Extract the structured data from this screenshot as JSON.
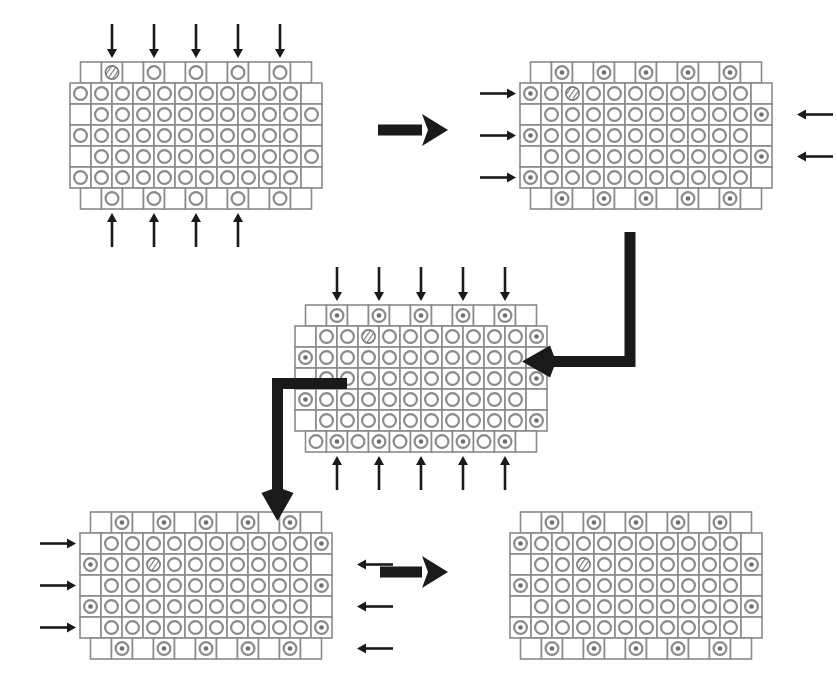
{
  "figure": {
    "background_color": "#ffffff",
    "cell_stroke_color": "#8a8a8a",
    "ring_stroke_color": "#8a8a8a",
    "dot_color": "#6e6e6e",
    "arrow_color": "#1a1a1a",
    "width": 815,
    "height": 683
  },
  "legend": {
    "cell_empty": "empty-lattice-cell",
    "cell_ring": "plain-ring-cell",
    "cell_ring_dot": "activated-ring-cell",
    "cell_hatched": "hatched-marker-cell"
  },
  "lattice": {
    "columns": 11,
    "rows": 7,
    "cell_size": 21,
    "description": "Staggered-edge rectangular lattice; interior rows of 11 cells with alternating left/right offset border cells; top and bottom rows hold alternating half-pitch cells."
  },
  "panels": [
    {
      "id": "panel-1",
      "name": "lattice-stage-1",
      "order": 1,
      "position": {
        "x": 70,
        "y": 62
      },
      "arrows": {
        "top": {
          "count": 5,
          "direction": "down",
          "label": "top-incident-arrows"
        },
        "bottom": {
          "count": 4,
          "direction": "up",
          "label": "bottom-incident-arrows"
        },
        "left": {
          "count": 0,
          "direction": "right",
          "label": "left-incident-arrows"
        },
        "right": {
          "count": 0,
          "direction": "left",
          "label": "right-incident-arrows"
        }
      },
      "marker_cell": {
        "row": 0,
        "col": 1,
        "type": "hatched"
      },
      "activated_count": 0
    },
    {
      "id": "panel-2",
      "name": "lattice-stage-2",
      "order": 2,
      "position": {
        "x": 520,
        "y": 62
      },
      "arrows": {
        "top": {
          "count": 0,
          "direction": "down",
          "label": "top-incident-arrows"
        },
        "bottom": {
          "count": 0,
          "direction": "up",
          "label": "bottom-incident-arrows"
        },
        "left": {
          "count": 3,
          "direction": "right",
          "label": "left-incident-arrows"
        },
        "right": {
          "count": 2,
          "direction": "left",
          "label": "right-incident-arrows"
        }
      },
      "marker_cell": {
        "row": 1,
        "col": 2,
        "type": "hatched"
      },
      "activated_count": 15
    },
    {
      "id": "panel-3",
      "name": "lattice-stage-3",
      "order": 3,
      "position": {
        "x": 295,
        "y": 305
      },
      "arrows": {
        "top": {
          "count": 5,
          "direction": "down",
          "label": "top-incident-arrows"
        },
        "bottom": {
          "count": 5,
          "direction": "up",
          "label": "bottom-incident-arrows"
        },
        "left": {
          "count": 0,
          "direction": "right",
          "label": "left-incident-arrows"
        },
        "right": {
          "count": 0,
          "direction": "left",
          "label": "right-incident-arrows"
        }
      },
      "marker_cell": {
        "row": 1,
        "col": 3,
        "type": "hatched"
      },
      "activated_count": 20
    },
    {
      "id": "panel-4",
      "name": "lattice-stage-4",
      "order": 4,
      "position": {
        "x": 80,
        "y": 512
      },
      "arrows": {
        "top": {
          "count": 0,
          "direction": "down",
          "label": "top-incident-arrows"
        },
        "bottom": {
          "count": 0,
          "direction": "up",
          "label": "bottom-incident-arrows"
        },
        "left": {
          "count": 3,
          "direction": "right",
          "label": "left-incident-arrows"
        },
        "right": {
          "count": 3,
          "direction": "left",
          "label": "right-incident-arrows"
        }
      },
      "marker_cell": {
        "row": 2,
        "col": 3,
        "type": "hatched"
      },
      "activated_count": 25
    },
    {
      "id": "panel-5",
      "name": "lattice-stage-5-final",
      "order": 5,
      "position": {
        "x": 510,
        "y": 512
      },
      "arrows": {
        "top": {
          "count": 0,
          "direction": "down",
          "label": "top-incident-arrows"
        },
        "bottom": {
          "count": 0,
          "direction": "up",
          "label": "bottom-incident-arrows"
        },
        "left": {
          "count": 0,
          "direction": "right",
          "label": "left-incident-arrows"
        },
        "right": {
          "count": 0,
          "direction": "left",
          "label": "right-incident-arrows"
        }
      },
      "marker_cell": {
        "row": 2,
        "col": 4,
        "type": "hatched"
      },
      "activated_count": 28
    }
  ],
  "connectors": [
    {
      "id": "connector-1-2",
      "name": "connector-stage1-to-stage2",
      "type": "straight-arrow",
      "direction": "right",
      "from": "panel-1",
      "to": "panel-2",
      "x": 378,
      "y": 130,
      "length": 70
    },
    {
      "id": "connector-2-3",
      "name": "connector-stage2-to-stage3",
      "type": "elbow-arrow",
      "direction": "down-then-left",
      "from": "panel-2",
      "to": "panel-3",
      "x": 630,
      "y": 232,
      "drop": 135,
      "run": 80
    },
    {
      "id": "connector-3-4",
      "name": "connector-stage3-to-stage4",
      "type": "elbow-arrow",
      "direction": "left-then-down",
      "from": "panel-3",
      "to": "panel-4",
      "x": 272,
      "y": 378,
      "run": 75,
      "drop": 115
    },
    {
      "id": "connector-4-5",
      "name": "connector-stage4-to-stage5",
      "type": "straight-arrow",
      "direction": "right",
      "from": "panel-4",
      "to": "panel-5",
      "x": 380,
      "y": 572,
      "length": 68
    }
  ],
  "lattice_maps": {
    "panel-1": {
      "top_row": [
        "e",
        "H",
        "e",
        "R",
        "e",
        "R",
        "e",
        "R",
        "e",
        "R",
        "e"
      ],
      "rows": [
        {
          "left": "R",
          "cells": [
            "R",
            "R",
            "R",
            "R",
            "R",
            "R",
            "R",
            "R",
            "R",
            "R"
          ],
          "right": "e"
        },
        {
          "left": "e",
          "cells": [
            "R",
            "R",
            "R",
            "R",
            "R",
            "R",
            "R",
            "R",
            "R",
            "R"
          ],
          "right": "R"
        },
        {
          "left": "R",
          "cells": [
            "R",
            "R",
            "R",
            "R",
            "R",
            "R",
            "R",
            "R",
            "R",
            "R"
          ],
          "right": "e"
        },
        {
          "left": "e",
          "cells": [
            "R",
            "R",
            "R",
            "R",
            "R",
            "R",
            "R",
            "R",
            "R",
            "R"
          ],
          "right": "R"
        },
        {
          "left": "R",
          "cells": [
            "R",
            "R",
            "R",
            "R",
            "R",
            "R",
            "R",
            "R",
            "R",
            "R"
          ],
          "right": "e"
        }
      ],
      "bottom_row": [
        "e",
        "R",
        "e",
        "R",
        "e",
        "R",
        "e",
        "R",
        "e",
        "R",
        "e"
      ]
    },
    "panel-2": {
      "top_row": [
        "e",
        "D",
        "e",
        "D",
        "e",
        "D",
        "e",
        "D",
        "e",
        "D",
        "e"
      ],
      "rows": [
        {
          "left": "D",
          "cells": [
            "R",
            "H",
            "R",
            "R",
            "R",
            "R",
            "R",
            "R",
            "R",
            "R"
          ],
          "right": "e"
        },
        {
          "left": "e",
          "cells": [
            "R",
            "R",
            "R",
            "R",
            "R",
            "R",
            "R",
            "R",
            "R",
            "R"
          ],
          "right": "D"
        },
        {
          "left": "D",
          "cells": [
            "R",
            "R",
            "R",
            "R",
            "R",
            "R",
            "R",
            "R",
            "R",
            "R"
          ],
          "right": "e"
        },
        {
          "left": "e",
          "cells": [
            "R",
            "R",
            "R",
            "R",
            "R",
            "R",
            "R",
            "R",
            "R",
            "R"
          ],
          "right": "D"
        },
        {
          "left": "D",
          "cells": [
            "R",
            "R",
            "R",
            "R",
            "R",
            "R",
            "R",
            "R",
            "R",
            "R"
          ],
          "right": "e"
        }
      ],
      "bottom_row": [
        "e",
        "D",
        "e",
        "D",
        "e",
        "D",
        "e",
        "D",
        "e",
        "D",
        "e"
      ]
    },
    "panel-3": {
      "top_row": [
        "e",
        "D",
        "e",
        "D",
        "e",
        "D",
        "e",
        "D",
        "e",
        "D",
        "e"
      ],
      "rows": [
        {
          "left": "e",
          "cells": [
            "R",
            "R",
            "H",
            "R",
            "R",
            "R",
            "R",
            "R",
            "R",
            "R"
          ],
          "right": "D"
        },
        {
          "left": "D",
          "cells": [
            "R",
            "R",
            "R",
            "R",
            "R",
            "R",
            "R",
            "R",
            "R",
            "R"
          ],
          "right": "e"
        },
        {
          "left": "e",
          "cells": [
            "R",
            "R",
            "R",
            "R",
            "R",
            "R",
            "R",
            "R",
            "R",
            "R"
          ],
          "right": "D"
        },
        {
          "left": "D",
          "cells": [
            "R",
            "R",
            "R",
            "R",
            "R",
            "R",
            "R",
            "R",
            "R",
            "R"
          ],
          "right": "e"
        },
        {
          "left": "e",
          "cells": [
            "R",
            "R",
            "R",
            "R",
            "R",
            "R",
            "R",
            "R",
            "R",
            "R"
          ],
          "right": "D"
        }
      ],
      "bottom_row": [
        "R",
        "D",
        "R",
        "D",
        "R",
        "D",
        "R",
        "D",
        "R",
        "D",
        "e"
      ]
    },
    "panel-4": {
      "top_row": [
        "e",
        "D",
        "e",
        "D",
        "e",
        "D",
        "e",
        "D",
        "e",
        "D",
        "e"
      ],
      "rows": [
        {
          "left": "e",
          "cells": [
            "R",
            "R",
            "R",
            "R",
            "R",
            "R",
            "R",
            "R",
            "R",
            "R"
          ],
          "right": "D"
        },
        {
          "left": "D",
          "cells": [
            "R",
            "R",
            "H",
            "R",
            "R",
            "R",
            "R",
            "R",
            "R",
            "R"
          ],
          "right": "e"
        },
        {
          "left": "e",
          "cells": [
            "R",
            "R",
            "R",
            "R",
            "R",
            "R",
            "R",
            "R",
            "R",
            "R"
          ],
          "right": "D"
        },
        {
          "left": "D",
          "cells": [
            "R",
            "R",
            "R",
            "R",
            "R",
            "R",
            "R",
            "R",
            "R",
            "R"
          ],
          "right": "e"
        },
        {
          "left": "e",
          "cells": [
            "R",
            "R",
            "R",
            "R",
            "R",
            "R",
            "R",
            "R",
            "R",
            "R"
          ],
          "right": "D"
        }
      ],
      "bottom_row": [
        "e",
        "D",
        "e",
        "D",
        "e",
        "D",
        "e",
        "D",
        "e",
        "D",
        "e"
      ]
    },
    "panel-5": {
      "top_row": [
        "e",
        "D",
        "e",
        "D",
        "e",
        "D",
        "e",
        "D",
        "e",
        "D",
        "e"
      ],
      "rows": [
        {
          "left": "D",
          "cells": [
            "R",
            "R",
            "R",
            "R",
            "R",
            "R",
            "R",
            "R",
            "R",
            "R"
          ],
          "right": "e"
        },
        {
          "left": "e",
          "cells": [
            "R",
            "R",
            "H",
            "R",
            "R",
            "R",
            "R",
            "R",
            "R",
            "R"
          ],
          "right": "D"
        },
        {
          "left": "D",
          "cells": [
            "R",
            "R",
            "R",
            "R",
            "R",
            "R",
            "R",
            "R",
            "R",
            "R"
          ],
          "right": "e"
        },
        {
          "left": "e",
          "cells": [
            "R",
            "R",
            "R",
            "R",
            "R",
            "R",
            "R",
            "R",
            "R",
            "R"
          ],
          "right": "D"
        },
        {
          "left": "D",
          "cells": [
            "R",
            "R",
            "R",
            "R",
            "R",
            "R",
            "R",
            "R",
            "R",
            "R"
          ],
          "right": "e"
        }
      ],
      "bottom_row": [
        "e",
        "D",
        "e",
        "D",
        "e",
        "D",
        "e",
        "D",
        "e",
        "D",
        "e"
      ]
    }
  }
}
